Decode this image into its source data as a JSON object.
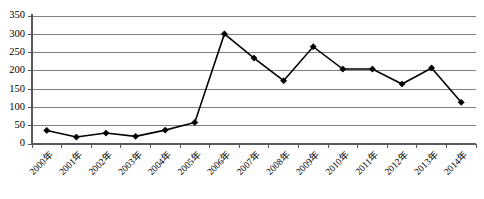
{
  "chart_data": {
    "type": "line",
    "title": "",
    "subtitle": "",
    "xlabel": "",
    "ylabel": "",
    "categories": [
      "2000年",
      "2001年",
      "2002年",
      "2003年",
      "2004年",
      "2005年",
      "2006年",
      "2007年",
      "2008年",
      "2009年",
      "2010年",
      "2011年",
      "2012年",
      "2013年",
      "2014年"
    ],
    "values": [
      37,
      19,
      30,
      21,
      38,
      59,
      301,
      235,
      173,
      266,
      205,
      205,
      164,
      208,
      114
    ],
    "series": [
      {
        "name": "",
        "values": [
          37,
          19,
          30,
          21,
          38,
          59,
          301,
          235,
          173,
          266,
          205,
          205,
          164,
          208,
          114
        ]
      }
    ],
    "ylim": [
      0,
      350
    ],
    "ytick_values": [
      0,
      50,
      100,
      150,
      200,
      250,
      300,
      350
    ],
    "ytick_labels": [
      "0",
      "50",
      "100",
      "150",
      "200",
      "250",
      "300",
      "350"
    ],
    "grid": "horizontal",
    "legend": "none",
    "marker": "diamond",
    "line_color": "#000000",
    "grid_color": "#808080",
    "axis_color": "#595959",
    "xtick_rotation": -45
  }
}
